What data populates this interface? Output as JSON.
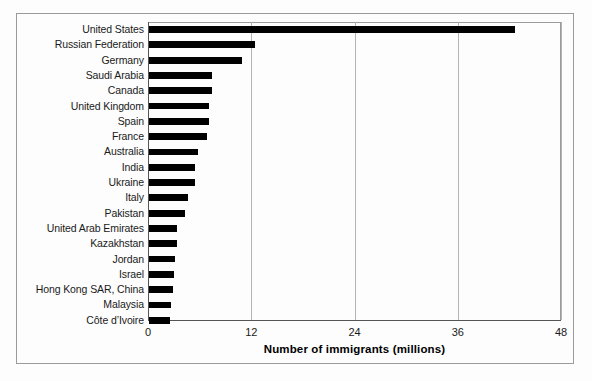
{
  "chart_data": {
    "type": "bar",
    "orientation": "horizontal",
    "title": "",
    "xlabel": "Number of immigrants (millions)",
    "ylabel": "",
    "xlim": [
      0,
      48
    ],
    "xticks": [
      0,
      12,
      24,
      36,
      48
    ],
    "xtick_labels": [
      "0",
      "12",
      "24",
      "36",
      "48"
    ],
    "grid": "vertical",
    "legend": "none",
    "bar_color": "#000000",
    "categories": [
      "United States",
      "Russian Federation",
      "Germany",
      "Saudi Arabia",
      "Canada",
      "United Kingdom",
      "Spain",
      "France",
      "Australia",
      "India",
      "Ukraine",
      "Italy",
      "Pakistan",
      "United Arab Emirates",
      "Kazakhstan",
      "Jordan",
      "Israel",
      "Hong Kong SAR, China",
      "Malaysia",
      "Côte d’Ivoire"
    ],
    "values": [
      42.5,
      12.3,
      10.8,
      7.3,
      7.3,
      7.0,
      7.0,
      6.7,
      5.7,
      5.4,
      5.3,
      4.5,
      4.2,
      3.3,
      3.3,
      3.0,
      2.9,
      2.8,
      2.5,
      2.4
    ]
  },
  "axis": {
    "xlabel": "Number of immigrants (millions)"
  }
}
